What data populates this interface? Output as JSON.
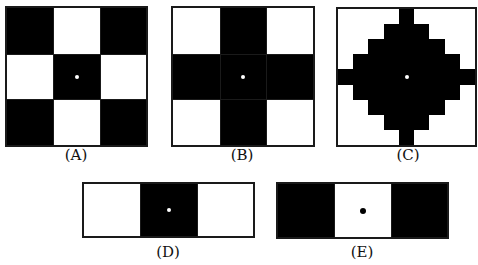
{
  "figures": [
    {
      "id": "A",
      "label": "(A)",
      "description": "3x3 checkerboard: black corners and center, white edge-middles, white dot at center",
      "grid": [
        [
          1,
          0,
          1
        ],
        [
          0,
          1,
          0
        ],
        [
          1,
          0,
          1
        ]
      ],
      "dot_color": "#ffffff"
    },
    {
      "id": "B",
      "label": "(B)",
      "description": "3x3 grid: black plus/cross shape, white corners, white dot at center",
      "grid": [
        [
          0,
          1,
          0
        ],
        [
          1,
          1,
          1
        ],
        [
          0,
          1,
          0
        ]
      ],
      "dot_color": "#ffffff"
    },
    {
      "id": "C",
      "label": "(C)",
      "description": "9x9 stepped diamond in black with arms to each edge, white dot at center",
      "grid": [
        [
          0,
          0,
          0,
          0,
          1,
          0,
          0,
          0,
          0
        ],
        [
          0,
          0,
          0,
          1,
          1,
          1,
          0,
          0,
          0
        ],
        [
          0,
          0,
          1,
          1,
          1,
          1,
          1,
          0,
          0
        ],
        [
          0,
          1,
          1,
          1,
          1,
          1,
          1,
          1,
          0
        ],
        [
          1,
          1,
          1,
          1,
          1,
          1,
          1,
          1,
          1
        ],
        [
          0,
          1,
          1,
          1,
          1,
          1,
          1,
          1,
          0
        ],
        [
          0,
          0,
          1,
          1,
          1,
          1,
          1,
          0,
          0
        ],
        [
          0,
          0,
          0,
          1,
          1,
          1,
          0,
          0,
          0
        ],
        [
          0,
          0,
          0,
          0,
          1,
          0,
          0,
          0,
          0
        ]
      ],
      "dot_color": "#ffffff"
    },
    {
      "id": "D",
      "label": "(D)",
      "description": "1x3 strip: white, black, white, white dot at center",
      "grid": [
        [
          0,
          1,
          0
        ]
      ],
      "dot_color": "#ffffff"
    },
    {
      "id": "E",
      "label": "(E)",
      "description": "1x3 strip: black, white, black, black dot at center",
      "grid": [
        [
          1,
          0,
          1
        ]
      ],
      "dot_color": "#000000"
    }
  ],
  "colors": {
    "black": "#000000",
    "white": "#ffffff",
    "border": "#1a1a1a"
  }
}
